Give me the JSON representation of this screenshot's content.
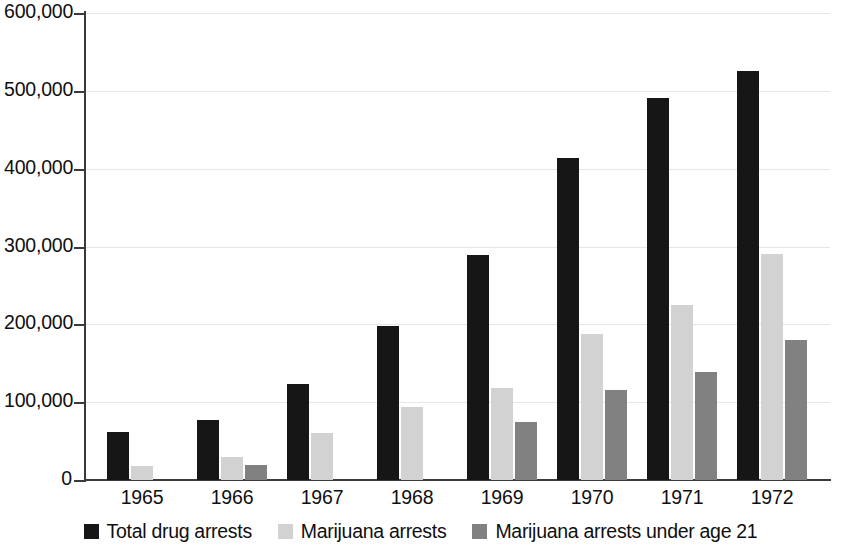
{
  "chart_data": {
    "type": "bar",
    "title": "",
    "xlabel": "",
    "ylabel": "",
    "categories": [
      "1965",
      "1966",
      "1967",
      "1968",
      "1969",
      "1970",
      "1971",
      "1972"
    ],
    "ylim": [
      0,
      600000
    ],
    "ytick_labels": [
      "0",
      "100,000",
      "200,000",
      "300,000",
      "400,000",
      "500,000",
      "600,000"
    ],
    "ytick_values": [
      0,
      100000,
      200000,
      300000,
      400000,
      500000,
      600000
    ],
    "grid": true,
    "legend_position": "bottom",
    "series": [
      {
        "name": "Total drug arrests",
        "color": "#161616",
        "values": [
          62000,
          77000,
          123000,
          198000,
          289000,
          414000,
          491000,
          526000
        ]
      },
      {
        "name": "Marijuana arrests",
        "color": "#d2d2d2",
        "values": [
          18000,
          30000,
          61000,
          94000,
          118000,
          188000,
          225000,
          291000
        ]
      },
      {
        "name": "Marijuana arrests under age 21",
        "color": "#818181",
        "values": [
          0,
          19000,
          0,
          0,
          75000,
          116000,
          139000,
          180000
        ]
      }
    ]
  }
}
